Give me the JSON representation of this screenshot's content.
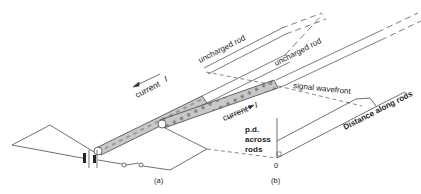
{
  "figure": {
    "panel_a_label": "(a)",
    "panel_b_label": "(b)",
    "rod_a_label": "uncharged rod",
    "rod_b_label": "uncharged rod",
    "current_a_label": "current",
    "current_a_symbol": "I",
    "current_b_label": "current",
    "current_b_symbol": "I",
    "wavefront_label": "signal wavefront",
    "y_axis_label_line1": "p.d.",
    "y_axis_label_line2": "across",
    "y_axis_label_line3": "rods",
    "x_axis_label": "Distance along rods",
    "origin_label": "0",
    "colors": {
      "line": "#333333",
      "rod_fill": "#c8c8c8",
      "background": "#ffffff"
    }
  }
}
